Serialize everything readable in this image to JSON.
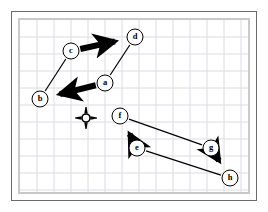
{
  "figure": {
    "canvas": {
      "width": 268,
      "height": 212
    },
    "background_color": "#ffffff",
    "outer_frame_color": "#6b6b6b",
    "inner_frame_color": "#c9c9c9",
    "grid": {
      "color": "#dcdce4",
      "spacing": 17,
      "visible": true
    },
    "plot_area": {
      "x": 20,
      "y": 20,
      "width": 228,
      "height": 172
    }
  },
  "nodes": [
    {
      "id": "a",
      "label": "a",
      "x": 105,
      "y": 83,
      "r": 8
    },
    {
      "id": "b",
      "label": "b",
      "x": 40,
      "y": 99,
      "r": 8
    },
    {
      "id": "c",
      "label": "c",
      "x": 71,
      "y": 51,
      "r": 8
    },
    {
      "id": "d",
      "label": "d",
      "x": 135,
      "y": 37,
      "r": 8
    },
    {
      "id": "e",
      "label": "e",
      "x": 137,
      "y": 148,
      "r": 8
    },
    {
      "id": "f",
      "label": "f",
      "x": 120,
      "y": 116,
      "r": 8
    },
    {
      "id": "g",
      "label": "g",
      "x": 211,
      "y": 148,
      "r": 8
    },
    {
      "id": "h",
      "label": "h",
      "x": 230,
      "y": 178,
      "r": 8
    }
  ],
  "node_style": {
    "fill": "#ffffff",
    "stroke": "#000000",
    "stroke_width": 1,
    "label_color": "#000000"
  },
  "edges": [
    {
      "id": "c-d",
      "from": "c",
      "to": "d",
      "weight": "thick",
      "width": 6,
      "arrow": "end"
    },
    {
      "id": "a-b",
      "from": "a",
      "to": "b",
      "weight": "thick",
      "width": 6,
      "arrow": "end"
    },
    {
      "id": "e-f",
      "from": "e",
      "to": "f",
      "weight": "thick",
      "width": 6,
      "arrow": "end"
    },
    {
      "id": "g-h",
      "from": "g",
      "to": "h",
      "weight": "thick",
      "width": 6,
      "arrow": "end"
    },
    {
      "id": "b-c",
      "from": "b",
      "to": "c",
      "weight": "thin",
      "width": 1.2,
      "arrow": "none"
    },
    {
      "id": "a-d",
      "from": "a",
      "to": "d",
      "weight": "thin",
      "width": 1.2,
      "arrow": "none"
    },
    {
      "id": "f-g",
      "from": "f",
      "to": "g",
      "weight": "thin",
      "width": 1.2,
      "arrow": "none"
    },
    {
      "id": "e-h",
      "from": "e",
      "to": "h",
      "weight": "thin",
      "width": 1.2,
      "arrow": "none"
    }
  ],
  "edge_style": {
    "color": "#000000"
  },
  "marker": {
    "name": "crosshair-target",
    "x": 86,
    "y": 118,
    "ring_radius": 4,
    "spike_length": 11,
    "color": "#000000"
  }
}
